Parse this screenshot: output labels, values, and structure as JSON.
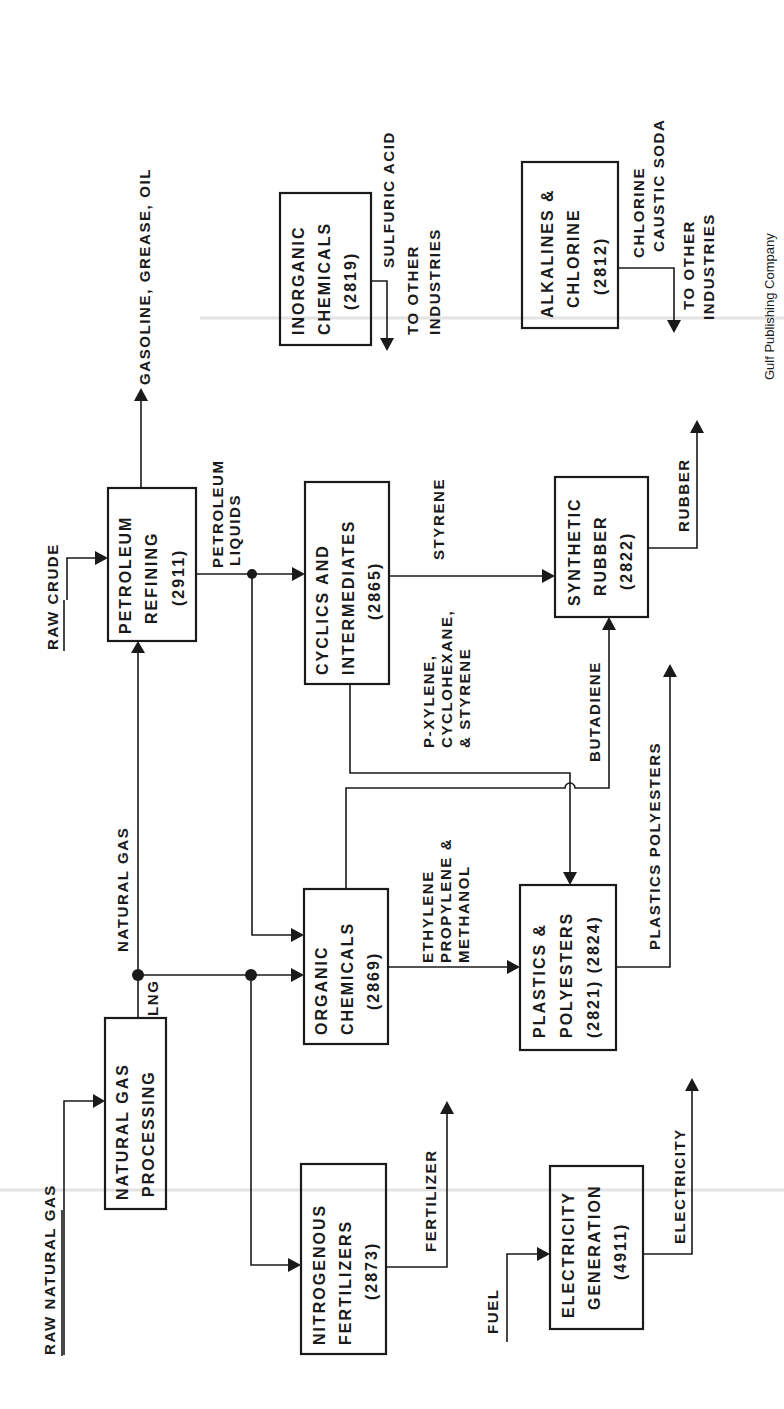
{
  "figure": {
    "orientation": "rotated-90-ccw",
    "credit": "Gulf Publishing Company",
    "inputs": {
      "raw_natural_gas": "RAW NATURAL GAS",
      "raw_crude": "RAW CRUDE",
      "fuel": "FUEL"
    },
    "nodes": {
      "natural_gas_processing": {
        "line1": "NATURAL GAS",
        "line2": "PROCESSING"
      },
      "nitrogenous_fertilizers": {
        "line1": "NITROGENOUS",
        "line2": "FERTILIZERS",
        "code": "(2873)"
      },
      "electricity_generation": {
        "line1": "ELECTRICITY",
        "line2": "GENERATION",
        "code": "(4911)"
      },
      "organic_chemicals": {
        "line1": "ORGANIC",
        "line2": "CHEMICALS",
        "code": "(2869)"
      },
      "plastics_polyesters": {
        "line1": "PLASTICS &",
        "line2": "POLYESTERS",
        "code": "(2821) (2824)"
      },
      "petroleum_refining": {
        "line1": "PETROLEUM",
        "line2": "REFINING",
        "code": "(2911)"
      },
      "cyclics_intermediates": {
        "line1": "CYCLICS AND",
        "line2": "INTERMEDIATES",
        "code": "(2865)"
      },
      "synthetic_rubber": {
        "line1": "SYNTHETIC",
        "line2": "RUBBER",
        "code": "(2822)"
      },
      "inorganic_chemicals": {
        "line1": "INORGANIC",
        "line2": "CHEMICALS",
        "code": "(2819)"
      },
      "alkalines_chlorine": {
        "line1": "ALKALINES &",
        "line2": "CHLORINE",
        "code": "(2812)"
      }
    },
    "flows": {
      "lng": "LNG",
      "natural_gas": "NATURAL GAS",
      "petroleum_liquids_1": "PETROLEUM",
      "petroleum_liquids_2": "LIQUIDS",
      "gasoline": "GASOLINE, GREASE, OIL",
      "fertilizer": "FERTILIZER",
      "electricity": "ELECTRICITY",
      "ethylene_1": "ETHYLENE",
      "ethylene_2": "PROPYLENE &",
      "ethylene_3": "METHANOL",
      "pxylene_1": "P-XYLENE,",
      "pxylene_2": "CYCLOHEXANE,",
      "pxylene_3": "& STYRENE",
      "styrene": "STYRENE",
      "butadiene": "BUTADIENE",
      "plastics_out": "PLASTICS POLYESTERS",
      "rubber_out": "RUBBER",
      "sulfuric_1": "SULFURIC ACID",
      "sulfuric_2": "TO OTHER",
      "sulfuric_3": "INDUSTRIES",
      "chlorine_1": "CHLORINE",
      "chlorine_2": "CAUSTIC SODA",
      "chlorine_3": "TO OTHER",
      "chlorine_4": "INDUSTRIES"
    }
  }
}
